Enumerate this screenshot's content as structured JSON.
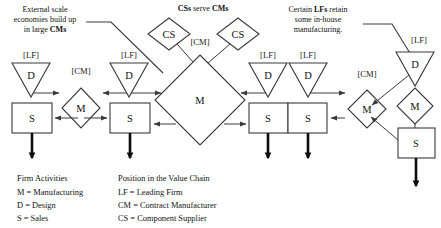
{
  "figure": {
    "title_annotations": [
      {
        "id": "note-scale-economies",
        "lines": [
          "External scale",
          "economies build up",
          "in large CMs"
        ],
        "bold_terms": [
          "CMs"
        ]
      },
      {
        "id": "note-cs-serve-cms",
        "lines": [
          "CSs serve CMs"
        ],
        "bold_terms": [
          "CSs",
          "CMs"
        ]
      },
      {
        "id": "note-lf-inhouse",
        "lines": [
          "Certain LFs retain",
          "some in-house",
          "manufacturing."
        ],
        "bold_terms": [
          "LFs"
        ]
      }
    ],
    "nodes": [
      {
        "id": "n1",
        "shape": "triangle",
        "glyph": "D",
        "tag": "[LF]"
      },
      {
        "id": "n2",
        "shape": "box",
        "glyph": "S",
        "tag": ""
      },
      {
        "id": "n3",
        "shape": "diamond",
        "glyph": "M",
        "tag": "[CM]"
      },
      {
        "id": "n4",
        "shape": "triangle",
        "glyph": "D",
        "tag": "[LF]"
      },
      {
        "id": "n5",
        "shape": "box",
        "glyph": "S",
        "tag": ""
      },
      {
        "id": "n6",
        "shape": "diamond-large",
        "glyph": "M",
        "tag": "[CM]"
      },
      {
        "id": "n7",
        "shape": "diamond",
        "glyph": "CS",
        "tag": ""
      },
      {
        "id": "n8",
        "shape": "diamond",
        "glyph": "CS",
        "tag": ""
      },
      {
        "id": "n9",
        "shape": "triangle",
        "glyph": "D",
        "tag": "[LF]"
      },
      {
        "id": "n10",
        "shape": "triangle",
        "glyph": "D",
        "tag": "[LF]"
      },
      {
        "id": "n11",
        "shape": "box",
        "glyph": "S",
        "tag": ""
      },
      {
        "id": "n12",
        "shape": "box",
        "glyph": "S",
        "tag": ""
      },
      {
        "id": "n13",
        "shape": "diamond",
        "glyph": "M",
        "tag": "[CM]"
      },
      {
        "id": "n14",
        "shape": "triangle",
        "glyph": "D",
        "tag": "[LF]"
      },
      {
        "id": "n15",
        "shape": "diamond",
        "glyph": "M",
        "tag": ""
      },
      {
        "id": "n16",
        "shape": "box",
        "glyph": "S",
        "tag": ""
      }
    ],
    "legend": {
      "col1": {
        "heading": "Firm Activities",
        "rows": [
          "M = Manufacturing",
          "D = Design",
          "S = Sales"
        ]
      },
      "col2": {
        "heading": "Position in the Value Chain",
        "rows": [
          "LF = Leading Firm",
          "CM = Contract Manufacturer",
          "CS = Component Supplier"
        ]
      }
    },
    "colors": {
      "stroke": "#3a3a3a",
      "text": "#111111",
      "background": "#ffffff",
      "outflow": "#0d0d0d"
    }
  }
}
